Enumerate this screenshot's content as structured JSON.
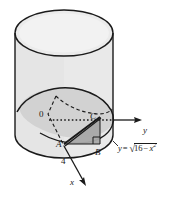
{
  "figure": {
    "kind": "cylinder-wedge-diagram",
    "background_color": "#ffffff",
    "colors": {
      "outline": "#1a1a1a",
      "cylinder_body": "#e8e8e8",
      "cylinder_top": "#e4e4e4",
      "wedge_plane": "#cfcfcf",
      "triangle_fill": "#a8a8a8",
      "base_shadow": "#d8d8d8"
    },
    "labels": {
      "origin": "0",
      "point_a": "A",
      "point_b": "B",
      "point_c": "C",
      "radius": "4",
      "axis_x": "x",
      "axis_y": "y"
    },
    "curve_equation": {
      "lhs": "y",
      "equals": "=",
      "radical": "√",
      "radicand_lead": "16",
      "radicand_minus": "−",
      "radicand_var": "x",
      "radicand_exp": "2"
    }
  }
}
